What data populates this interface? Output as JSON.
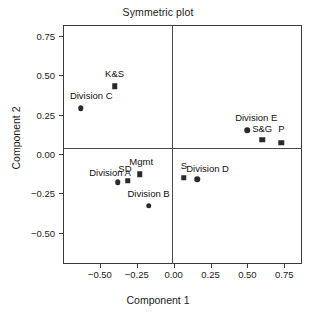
{
  "chart_data": {
    "type": "scatter",
    "title": "Symmetric plot",
    "xlabel": "Component 1",
    "ylabel": "Component 2",
    "xlim": [
      -0.75,
      0.87
    ],
    "ylim": [
      -0.7,
      0.82
    ],
    "grid": false,
    "legend": "none",
    "xticks": [
      "-0.50",
      "-0.25",
      "0.00",
      "0.25",
      "0.50",
      "0.75"
    ],
    "xtick_values": [
      -0.5,
      -0.25,
      0,
      0.25,
      0.5,
      0.75
    ],
    "yticks": [
      "0.75",
      "0.50",
      "0.25",
      "0.00",
      "-0.25",
      "-0.50"
    ],
    "ytick_values": [
      0.75,
      0.5,
      0.25,
      0,
      -0.25,
      -0.5
    ],
    "series": [
      {
        "name": "row-points",
        "marker": "circle",
        "color": "#2b2b2b",
        "points": [
          {
            "label": "Division C",
            "x": -0.63,
            "y": 0.29,
            "lx": -0.63,
            "ly": 0.36,
            "anchor": "start",
            "loff": -0.05
          },
          {
            "label": "Division A",
            "x": -0.38,
            "y": -0.18,
            "lx": -0.38,
            "ly": -0.13,
            "anchor": "end",
            "loff": 0.02
          },
          {
            "label": "Division B",
            "x": -0.17,
            "y": -0.33,
            "lx": -0.17,
            "ly": -0.26,
            "anchor": "middle",
            "loff": 0
          },
          {
            "label": "Division D",
            "x": 0.16,
            "y": -0.16,
            "lx": 0.16,
            "ly": -0.1,
            "anchor": "middle",
            "loff": 0.07
          },
          {
            "label": "Division E",
            "x": 0.5,
            "y": 0.15,
            "lx": 0.5,
            "ly": 0.22,
            "anchor": "middle",
            "loff": 0.06
          }
        ]
      },
      {
        "name": "column-points",
        "marker": "square",
        "color": "#2b2b2b",
        "points": [
          {
            "label": "K&S",
            "x": -0.4,
            "y": 0.43,
            "lx": -0.4,
            "ly": 0.5,
            "anchor": "middle",
            "loff": 0
          },
          {
            "label": "SD",
            "x": -0.31,
            "y": -0.17,
            "lx": -0.31,
            "ly": -0.1,
            "anchor": "middle",
            "loff": -0.02
          },
          {
            "label": "Mgmt",
            "x": -0.23,
            "y": -0.13,
            "lx": -0.23,
            "ly": -0.06,
            "anchor": "middle",
            "loff": 0.01
          },
          {
            "label": "S",
            "x": 0.07,
            "y": -0.15,
            "lx": 0.07,
            "ly": -0.08,
            "anchor": "middle",
            "loff": 0
          },
          {
            "label": "S&G",
            "x": 0.6,
            "y": 0.09,
            "lx": 0.6,
            "ly": 0.15,
            "anchor": "middle",
            "loff": 0
          },
          {
            "label": "P",
            "x": 0.73,
            "y": 0.07,
            "lx": 0.73,
            "ly": 0.15,
            "anchor": "middle",
            "loff": 0
          }
        ]
      }
    ]
  }
}
